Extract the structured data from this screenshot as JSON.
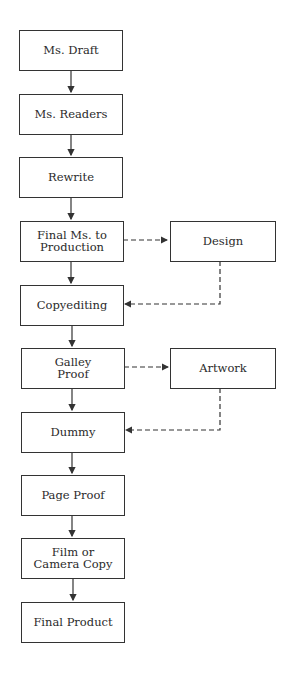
{
  "diagram": {
    "type": "flowchart",
    "nodes": [
      {
        "id": "ms_draft",
        "label": "Ms. Draft"
      },
      {
        "id": "ms_readers",
        "label": "Ms. Readers"
      },
      {
        "id": "rewrite",
        "label": "Rewrite"
      },
      {
        "id": "final_ms",
        "label": "Final Ms. to\nProduction"
      },
      {
        "id": "design",
        "label": "Design"
      },
      {
        "id": "copyediting",
        "label": "Copyediting"
      },
      {
        "id": "galley_proof",
        "label": "Galley\nProof"
      },
      {
        "id": "artwork",
        "label": "Artwork"
      },
      {
        "id": "dummy",
        "label": "Dummy"
      },
      {
        "id": "page_proof",
        "label": "Page Proof"
      },
      {
        "id": "film",
        "label": "Film or\nCamera Copy"
      },
      {
        "id": "final_product",
        "label": "Final Product"
      }
    ],
    "edges": [
      {
        "from": "ms_draft",
        "to": "ms_readers",
        "style": "solid"
      },
      {
        "from": "ms_readers",
        "to": "rewrite",
        "style": "solid"
      },
      {
        "from": "rewrite",
        "to": "final_ms",
        "style": "solid"
      },
      {
        "from": "final_ms",
        "to": "design",
        "style": "dashed"
      },
      {
        "from": "final_ms",
        "to": "copyediting",
        "style": "solid"
      },
      {
        "from": "design",
        "to": "copyediting",
        "style": "dashed"
      },
      {
        "from": "copyediting",
        "to": "galley_proof",
        "style": "solid"
      },
      {
        "from": "galley_proof",
        "to": "artwork",
        "style": "dashed"
      },
      {
        "from": "galley_proof",
        "to": "dummy",
        "style": "solid"
      },
      {
        "from": "artwork",
        "to": "dummy",
        "style": "dashed"
      },
      {
        "from": "dummy",
        "to": "page_proof",
        "style": "solid"
      },
      {
        "from": "page_proof",
        "to": "film",
        "style": "solid"
      },
      {
        "from": "film",
        "to": "final_product",
        "style": "solid"
      }
    ]
  }
}
